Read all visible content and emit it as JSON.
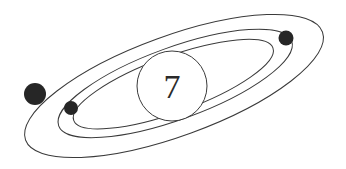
{
  "diagram": {
    "type": "atom-model",
    "nucleus": {
      "label": "7"
    },
    "orbits": [
      {
        "name": "outer",
        "electrons": 1
      },
      {
        "name": "middle",
        "electrons": 1
      },
      {
        "name": "inner",
        "electrons": 1
      }
    ],
    "colors": {
      "stroke": "#3a3a3a",
      "electron": "#262626",
      "background": "#ffffff"
    }
  }
}
